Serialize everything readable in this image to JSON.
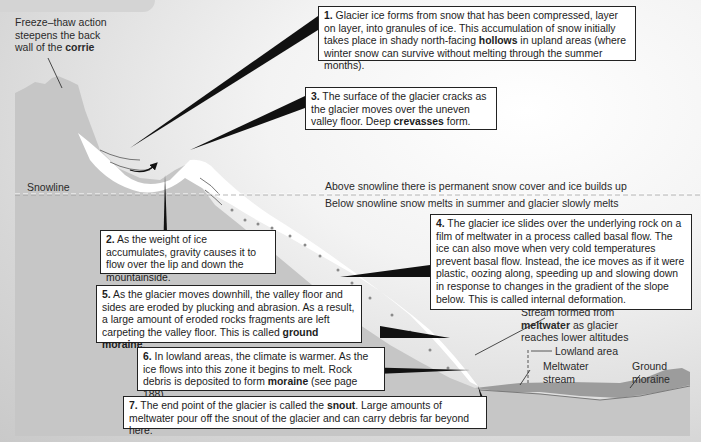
{
  "labels": {
    "freeze_thaw": {
      "pre": "Freeze–thaw action steepens the back wall of the ",
      "bold": "corrie"
    },
    "snowline": "Snowline",
    "above_snowline": "Above snowline there is permanent snow cover and ice builds up",
    "below_snowline": "Below snowline snow melts in summer and glacier slowly melts",
    "stream": {
      "bold": "meltwater",
      "pre": "Stream formed from",
      "post": " as glacier reaches lower altitudes"
    },
    "lowland_area": "Lowland area",
    "meltwater_stream": "Meltwater stream",
    "ground_moraine": "Ground moraine"
  },
  "boxes": [
    {
      "num": "1.",
      "pre": " Glacier ice forms from snow that has been compressed, layer on layer, into granules of ice. This accumulation of snow initially takes place in shady north-facing ",
      "bold": "hollows",
      "post": " in upland areas (where winter snow can survive without melting through the summer months)."
    },
    {
      "num": "2.",
      "pre": " As the weight of ice accumulates, gravity causes it to flow over the lip and down the mountainside.",
      "bold": "",
      "post": ""
    },
    {
      "num": "3.",
      "pre": " The surface of the glacier cracks as the glacier moves over the uneven valley floor. Deep ",
      "bold": "crevasses",
      "post": " form."
    },
    {
      "num": "4.",
      "pre": " The glacier ice slides over the underlying rock on a film of meltwater in a process called basal flow. The ice can also move when very cold temperatures prevent basal flow. Instead, the ice moves as if it were plastic, oozing along, speeding up and slowing down in response to changes in the gradient of the slope below. This is called internal deformation.",
      "bold": "",
      "post": ""
    },
    {
      "num": "5.",
      "pre": " As the glacier moves downhill, the valley floor and sides are eroded by plucking and abrasion. As a result, a large amount of eroded rocks fragments are left carpeting the valley floor. This is called ",
      "bold": "ground moraine",
      "post": "."
    },
    {
      "num": "6.",
      "pre": " In lowland areas, the climate is warmer. As the ice flows into this zone it begins to melt. Rock debris is deposited to form ",
      "bold": "moraine",
      "post": " (see page 188)."
    },
    {
      "num": "7.",
      "pre": " The end point of the glacier is called the ",
      "bold": "snout",
      "post": ". Large amounts of meltwater pour off the snout of the glacier and can carry debris far beyond here."
    }
  ],
  "colors": {
    "terrain": "#c8c8c8",
    "ice": "#ffffff",
    "moraine": "#9a9a9a",
    "pointer": "#111111"
  }
}
